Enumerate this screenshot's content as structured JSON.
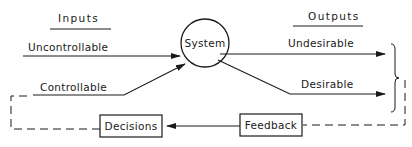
{
  "diagram": {
    "type": "system-feedback-flow",
    "headers": {
      "inputs": "Inputs",
      "outputs": "Outputs"
    },
    "system_node": {
      "label": "System",
      "shape": "circle"
    },
    "inputs": [
      {
        "label": "Uncontrollable",
        "direction": "into-system"
      },
      {
        "label": "Controllable",
        "direction": "into-system"
      }
    ],
    "outputs": [
      {
        "label": "Undesirable",
        "direction": "out-of-system"
      },
      {
        "label": "Desirable",
        "direction": "out-of-system"
      }
    ],
    "feedback_node": {
      "label": "Feedback",
      "shape": "box"
    },
    "decisions_node": {
      "label": "Decisions",
      "shape": "box"
    },
    "connections": [
      {
        "from": "Uncontrollable",
        "to": "System",
        "style": "solid-arrow"
      },
      {
        "from": "Controllable",
        "to": "System",
        "style": "solid-arrow"
      },
      {
        "from": "System",
        "to": "Undesirable",
        "style": "solid-arrow"
      },
      {
        "from": "System",
        "to": "Desirable",
        "style": "solid-arrow"
      },
      {
        "from": "Outputs",
        "to": "Feedback",
        "style": "dashed"
      },
      {
        "from": "Feedback",
        "to": "Decisions",
        "style": "solid-arrow"
      },
      {
        "from": "Decisions",
        "to": "Controllable",
        "style": "dashed"
      }
    ],
    "colors": {
      "stroke": "#1a1a1a",
      "background": "#ffffff"
    }
  }
}
